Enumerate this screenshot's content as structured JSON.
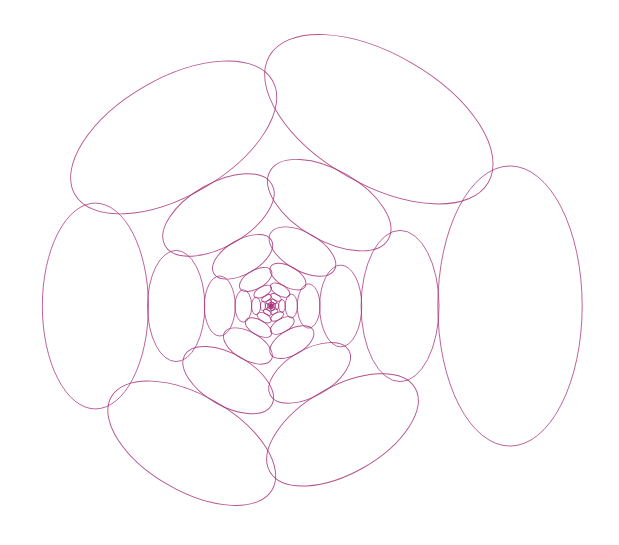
{
  "figure": {
    "background": "#ffffff",
    "stroke_color": "#a8327a",
    "stroke_width": 0.9,
    "stroke_opacity": 0.85
  },
  "spiral": {
    "center": [
      271,
      306
    ],
    "start_distance": 239,
    "start_angle_deg": 0,
    "angle_step_deg": -60,
    "scale_per_step": 0.9024,
    "tangential_semi_axis_ratio": 0.586,
    "radial_semi_axis_ratio": 0.302,
    "ellipses_per_turn": 6,
    "min_distance": 0.6
  },
  "outer_ring_measured": [
    {
      "position": "right",
      "center": [
        509,
        307
      ],
      "semi_tangential": 140,
      "semi_radial": 72
    },
    {
      "position": "top-right",
      "center": [
        378,
        115
      ],
      "semi_tangential": 127,
      "semi_radial": 65
    },
    {
      "position": "top-left",
      "center": [
        174,
        133
      ],
      "semi_tangential": 114,
      "semi_radial": 59
    },
    {
      "position": "left",
      "center": [
        97,
        306
      ],
      "semi_tangential": 101,
      "semi_radial": 53
    },
    {
      "position": "bottom-left",
      "center": [
        193,
        446
      ],
      "semi_tangential": 92,
      "semi_radial": 48
    },
    {
      "position": "bottom-right",
      "center": [
        342,
        432
      ],
      "semi_tangential": 83,
      "semi_radial": 43
    }
  ]
}
